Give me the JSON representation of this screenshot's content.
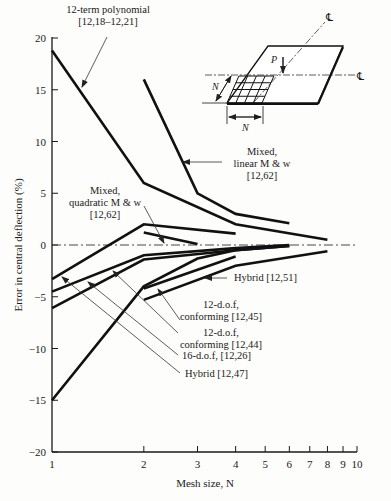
{
  "chart_data": {
    "type": "line",
    "title": "",
    "xlabel": "Mesh size, N",
    "ylabel": "Error in central deflection (%)",
    "xscale": "log",
    "xlim": [
      1,
      10
    ],
    "ylim": [
      -20,
      20
    ],
    "xticks": [
      1,
      2,
      3,
      4,
      5,
      6,
      7,
      8,
      9,
      10
    ],
    "yticks": [
      20,
      15,
      10,
      5,
      0,
      -5,
      -10,
      -15,
      -20
    ],
    "grid": false,
    "legend_position": "annotations",
    "zero_line": "dash-dot",
    "series": [
      {
        "name": "12-term polynomial [12,18-12,21]",
        "x": [
          1,
          2,
          4,
          8
        ],
        "y": [
          18.8,
          6.0,
          2.0,
          0.5
        ]
      },
      {
        "name": "Mixed, linear M & w [12,62]",
        "x": [
          2,
          3,
          4,
          6
        ],
        "y": [
          16.0,
          5.0,
          3.0,
          2.1
        ]
      },
      {
        "name": "Mixed, quadratic M & w [12,62] (upper)",
        "x": [
          1,
          2,
          4
        ],
        "y": [
          -3.3,
          2.0,
          1.1
        ]
      },
      {
        "name": "Mixed, quadratic M & w [12,62] (lower)",
        "x": [
          2,
          3
        ],
        "y": [
          1.2,
          0.1
        ]
      },
      {
        "name": "12-d.o.f. conforming [12,44]",
        "x": [
          1,
          2,
          4,
          6
        ],
        "y": [
          -4.5,
          -1.0,
          -0.3,
          0.0
        ]
      },
      {
        "name": "16-d.o.f. [12,26]",
        "x": [
          1,
          2,
          4,
          6
        ],
        "y": [
          -6.1,
          -1.4,
          -0.5,
          -0.1
        ]
      },
      {
        "name": "12-d.o.f. conforming [12,45]",
        "x": [
          2,
          4
        ],
        "y": [
          -4.2,
          -1.1
        ]
      },
      {
        "name": "Hybrid [12,51]",
        "x": [
          2,
          4,
          8
        ],
        "y": [
          -5.3,
          -2.0,
          -0.6
        ]
      },
      {
        "name": "Hybrid [12,47]",
        "x": [
          1,
          2,
          3,
          4,
          6
        ],
        "y": [
          -15.0,
          -4.0,
          -1.3,
          -0.5,
          -0.1
        ]
      }
    ],
    "annotations": [
      {
        "lines": [
          "12-term polynomial",
          "[12,18–12,21]"
        ],
        "label_xy": [
          108,
          13
        ],
        "anchor": "middle",
        "arrow_from": [
          107,
          37
        ],
        "arrow_to": [
          82,
          87
        ]
      },
      {
        "lines": [
          "Mixed,",
          "linear M & w",
          "[12,62]"
        ],
        "label_xy": [
          262,
          155
        ],
        "anchor": "middle",
        "arrow_from": [
          222,
          162
        ],
        "arrow_to": [
          183,
          162
        ]
      },
      {
        "lines": [
          "Mixed,",
          "quadratic M & w",
          "[12,62]"
        ],
        "label_xy": [
          105,
          194
        ],
        "anchor": "middle",
        "arrow_from": [
          144,
          206
        ],
        "arrow_to": [
          164,
          243
        ]
      },
      {
        "lines": [
          "Hybrid [12,51]"
        ],
        "label_xy": [
          234,
          281
        ],
        "anchor": "start",
        "arrow_from": [
          227,
          278
        ],
        "arrow_to": [
          205,
          278
        ]
      },
      {
        "lines": [
          "12-d.o.f,",
          "conforming [12,45]"
        ],
        "label_xy": [
          221,
          308
        ],
        "anchor": "middle",
        "arrow_from": [
          180,
          320
        ],
        "arrow_to": [
          158,
          289
        ]
      },
      {
        "lines": [
          "12-d.o.f,",
          "conforming [12,44]"
        ],
        "label_xy": [
          221,
          336
        ],
        "anchor": "middle",
        "arrow_from": [
          178,
          333
        ],
        "arrow_to": [
          113,
          271
        ]
      },
      {
        "lines": [
          "16-d.o.f, [12,26]"
        ],
        "label_xy": [
          182,
          359
        ],
        "anchor": "start",
        "arrow_from": [
          178,
          355
        ],
        "arrow_to": [
          88,
          282
        ]
      },
      {
        "lines": [
          "Hybrid [12,47]"
        ],
        "label_xy": [
          185,
          377
        ],
        "anchor": "start",
        "arrow_from": [
          180,
          373
        ],
        "arrow_to": [
          62,
          277
        ]
      }
    ],
    "inset": {
      "description": "Plate with N x N mesh under central point load P, symmetric about centerlines",
      "load_label": "P",
      "mesh_label": "N",
      "centerline_label": "℄"
    }
  }
}
